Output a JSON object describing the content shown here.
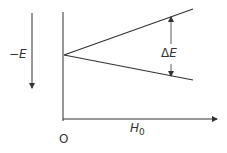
{
  "diagram": {
    "y_axis_label": "−E",
    "x_axis_label": "H",
    "x_axis_label_subscript": "0",
    "origin_label": "O",
    "gap_label_delta": "Δ",
    "gap_label_E": "E",
    "stroke_color": "#333333",
    "lines": [
      {
        "name": "upper-level",
        "from": [
          64,
          55
        ],
        "to": [
          193,
          9
        ]
      },
      {
        "name": "lower-level",
        "from": [
          64,
          55
        ],
        "to": [
          193,
          80
        ]
      }
    ]
  }
}
